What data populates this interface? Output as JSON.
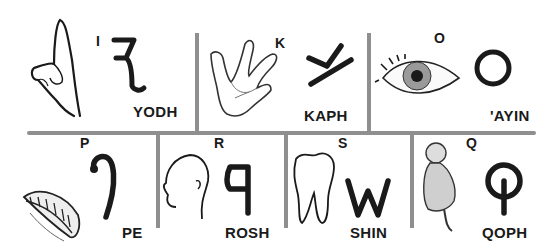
{
  "letters": [
    {
      "id": "yodh",
      "name": "YODH",
      "latin": "I",
      "picture": "hand-pointing",
      "glyph": "yodh-glyph"
    },
    {
      "id": "kaph",
      "name": "KAPH",
      "latin": "K",
      "picture": "open-hand",
      "glyph": "kaph-glyph"
    },
    {
      "id": "ayin",
      "name": "'AYIN",
      "latin": "O",
      "picture": "eye",
      "glyph": "ayin-glyph"
    },
    {
      "id": "pe",
      "name": "PE",
      "latin": "P",
      "picture": "mouth",
      "glyph": "pe-glyph"
    },
    {
      "id": "rosh",
      "name": "ROSH",
      "latin": "R",
      "picture": "head",
      "glyph": "rosh-glyph"
    },
    {
      "id": "shin",
      "name": "SHIN",
      "latin": "S",
      "picture": "tooth",
      "glyph": "shin-glyph"
    },
    {
      "id": "qoph",
      "name": "QOPH",
      "latin": "Q",
      "picture": "monkey",
      "glyph": "qoph-glyph"
    }
  ],
  "colors": {
    "divider": "#8f8f8f",
    "ink": "#1a1a1a",
    "background": "#ffffff"
  }
}
